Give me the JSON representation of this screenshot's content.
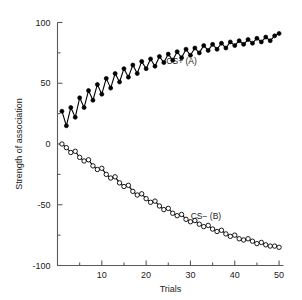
{
  "chart_data": {
    "type": "line",
    "title": "",
    "xlabel": "Trials",
    "ylabel": "Strength of association",
    "xlim": [
      0,
      51
    ],
    "ylim": [
      -100,
      100
    ],
    "grid": false,
    "legend_position": "inline-annotations",
    "x_major_ticks": [
      10,
      20,
      30,
      40,
      50
    ],
    "x_major_tick_labels": [
      "10",
      "20",
      "30",
      "40",
      "50"
    ],
    "x_minor_ticks": [
      5,
      15,
      25,
      35,
      45
    ],
    "y_major_ticks": [
      100,
      50,
      0,
      -50,
      -100
    ],
    "y_major_tick_labels": [
      "100",
      "50",
      "0",
      "-50",
      "-100"
    ],
    "y_minor_ticks": [
      75,
      25,
      -25,
      -75
    ],
    "x": [
      1,
      2,
      3,
      4,
      5,
      6,
      7,
      8,
      9,
      10,
      11,
      12,
      13,
      14,
      15,
      16,
      17,
      18,
      19,
      20,
      21,
      22,
      23,
      24,
      25,
      26,
      27,
      28,
      29,
      30,
      31,
      32,
      33,
      34,
      35,
      36,
      37,
      38,
      39,
      40,
      41,
      42,
      43,
      44,
      45,
      46,
      47,
      48,
      49,
      50
    ],
    "series": [
      {
        "name": "CS+ (A)",
        "label": "CS+ (A)",
        "marker": "filled-circle",
        "color": "#000000",
        "label_x": 28,
        "label_y": 66,
        "values": [
          27,
          15,
          30,
          22,
          38,
          30,
          44,
          36,
          49,
          41,
          54,
          46,
          58,
          51,
          62,
          55,
          65,
          58,
          68,
          62,
          70,
          64,
          72,
          67,
          74,
          69,
          76,
          71,
          78,
          73,
          79,
          75,
          81,
          77,
          82,
          78,
          83,
          79,
          84,
          81,
          85,
          82,
          86,
          83,
          87,
          84,
          88,
          85,
          89,
          91
        ]
      },
      {
        "name": "CS- (B)",
        "label": "CS− (B)",
        "marker": "open-circle",
        "color": "#000000",
        "label_x": 33.5,
        "label_y": -62,
        "values": [
          0,
          -3,
          -7,
          -6,
          -11,
          -14,
          -13,
          -18,
          -21,
          -20,
          -25,
          -28,
          -27,
          -32,
          -35,
          -34,
          -39,
          -42,
          -41,
          -45,
          -48,
          -47,
          -51,
          -54,
          -53,
          -57,
          -59,
          -58,
          -62,
          -64,
          -63,
          -66,
          -68,
          -67,
          -70,
          -72,
          -71,
          -74,
          -76,
          -75,
          -78,
          -79,
          -78,
          -80,
          -82,
          -81,
          -83,
          -84,
          -84,
          -85
        ]
      }
    ]
  }
}
